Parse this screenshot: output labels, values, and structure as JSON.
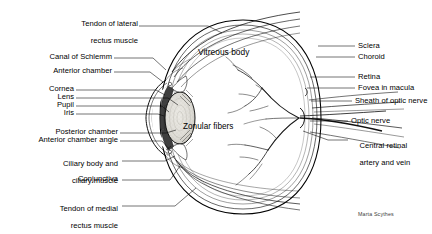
{
  "figure": {
    "credit": "Marta Scythes",
    "background_color": "#ffffff",
    "ink_color": "#000000",
    "lens_fill": "#dcdcd8",
    "iris_fill": "#4a4a4a",
    "vitreous_fill": "#ffffff"
  },
  "labels_left": [
    {
      "id": "tendon-lateral-rectus",
      "line1": "Tendon of lateral",
      "line2": "rectus muscle"
    },
    {
      "id": "canal-of-schlemm",
      "line1": "Canal of Schlemm",
      "line2": ""
    },
    {
      "id": "anterior-chamber",
      "line1": "Anterior chamber",
      "line2": ""
    },
    {
      "id": "cornea",
      "line1": "Cornea",
      "line2": ""
    },
    {
      "id": "lens",
      "line1": "Lens",
      "line2": ""
    },
    {
      "id": "pupil",
      "line1": "Pupil",
      "line2": ""
    },
    {
      "id": "iris",
      "line1": "Iris",
      "line2": ""
    },
    {
      "id": "posterior-chamber",
      "line1": "Posterior chamber",
      "line2": ""
    },
    {
      "id": "anterior-chamber-angle",
      "line1": "Anterior chamber angle",
      "line2": ""
    },
    {
      "id": "ciliary-body",
      "line1": "Ciliary body and",
      "line2": "ciliary muscle"
    },
    {
      "id": "conjunctiva",
      "line1": "Conjunctiva",
      "line2": ""
    },
    {
      "id": "tendon-medial-rectus",
      "line1": "Tendon of medial",
      "line2": "rectus muscle"
    }
  ],
  "labels_right": [
    {
      "id": "sclera",
      "line1": "Sclera",
      "line2": ""
    },
    {
      "id": "choroid",
      "line1": "Choroid",
      "line2": ""
    },
    {
      "id": "retina",
      "line1": "Retina",
      "line2": ""
    },
    {
      "id": "fovea-in-macula",
      "line1": "Fovea in macula",
      "line2": ""
    },
    {
      "id": "sheath-of-optic-nerve",
      "line1": "Sheath of optic nerve",
      "line2": ""
    },
    {
      "id": "optic-nerve",
      "line1": "Optic nerve",
      "line2": ""
    },
    {
      "id": "central-retinal-vessels",
      "line1": "Central retinal",
      "line2": "artery and vein"
    }
  ],
  "labels_inside": [
    {
      "id": "vitreous-body",
      "line1": "Vitreous body",
      "line2": ""
    },
    {
      "id": "zonular-fibers",
      "line1": "Zonular fibers",
      "line2": ""
    }
  ]
}
